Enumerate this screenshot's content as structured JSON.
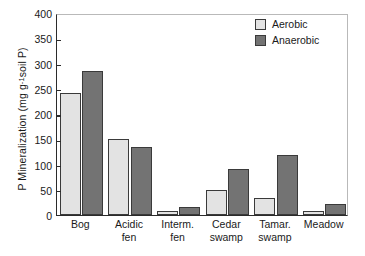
{
  "chart_data": {
    "type": "bar",
    "title": "",
    "xlabel": "",
    "ylabel_text": "P Mineralization (mg g",
    "ylabel_sup": "-1",
    "ylabel_tail": " soil P)",
    "ylim": [
      0,
      400
    ],
    "ytick_values": [
      0,
      50,
      100,
      150,
      200,
      250,
      300,
      350,
      400
    ],
    "ytick_labels": [
      "0",
      "50",
      "100",
      "150",
      "200",
      "250",
      "300",
      "350",
      "400"
    ],
    "grid": false,
    "legend_position": "top-right",
    "categories": [
      "Bog",
      "Acidic fen",
      "Interm. fen",
      "Cedar swamp",
      "Tamar. swamp",
      "Meadow"
    ],
    "category_lines": [
      [
        "Bog"
      ],
      [
        "Acidic",
        "fen"
      ],
      [
        "Interm.",
        "fen"
      ],
      [
        "Cedar",
        "swamp"
      ],
      [
        "Tamar.",
        "swamp"
      ],
      [
        "Meadow"
      ]
    ],
    "series": [
      {
        "name": "Aerobic",
        "color": "#e3e3e3",
        "values": [
          242,
          151,
          7,
          49,
          33,
          7
        ]
      },
      {
        "name": "Anaerobic",
        "color": "#737373",
        "values": [
          286,
          134,
          16,
          91,
          118,
          21
        ]
      }
    ]
  },
  "legend": {
    "items": [
      {
        "label": "Aerobic",
        "swatch": "aerobic"
      },
      {
        "label": "Anaerobic",
        "swatch": "anaerobic"
      }
    ]
  },
  "colors": {
    "aerobic": "#e3e3e3",
    "anaerobic": "#737373",
    "outline": "#3a3a3a",
    "axis": "#2b2b2b",
    "background": "#ffffff"
  }
}
